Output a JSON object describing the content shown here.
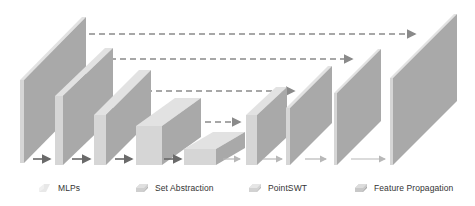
{
  "diagram": {
    "colors": {
      "front_light": "#d6d6d6",
      "side_dark": "#a9a9a9",
      "top_light": "#e2e2e2",
      "edge_thin": "#e8e8e8",
      "arrow_dark": "#6a6a6a",
      "arrow_light": "#b8b8b8",
      "dash": "#8a8a8a"
    },
    "blocks": [
      {
        "id": "enc1",
        "type": "MLPs",
        "x": 20,
        "y_top": 80,
        "bottom": 163,
        "depth_x": 62,
        "depth_y": 63,
        "thickness": 4
      },
      {
        "id": "enc2",
        "type": "Set Abstraction",
        "x": 55,
        "y_top": 96,
        "bottom": 165,
        "depth_x": 50,
        "depth_y": 48,
        "thickness": 8
      },
      {
        "id": "enc3",
        "type": "Set Abstraction",
        "x": 94,
        "y_top": 115,
        "bottom": 165,
        "depth_x": 45,
        "depth_y": 45,
        "thickness": 12
      },
      {
        "id": "enc4",
        "type": "Set Abstraction",
        "x": 136,
        "y_top": 126,
        "bottom": 165,
        "depth_x": 39,
        "depth_y": 28,
        "thickness": 26
      },
      {
        "id": "bottleneck",
        "type": "PointSWT",
        "x": 184,
        "y_top": 149,
        "bottom": 165,
        "depth_x": 29,
        "depth_y": 17,
        "thickness": 32
      },
      {
        "id": "dec1",
        "type": "Feature Propagation",
        "x": 246,
        "y_top": 115,
        "bottom": 165,
        "depth_x": 30,
        "depth_y": 28,
        "thickness": 11
      },
      {
        "id": "dec2",
        "type": "Feature Propagation",
        "x": 286,
        "y_top": 108,
        "bottom": 165,
        "depth_x": 42,
        "depth_y": 42,
        "thickness": 4
      },
      {
        "id": "dec3",
        "type": "Feature Propagation",
        "x": 334,
        "y_top": 93,
        "bottom": 165,
        "depth_x": 44,
        "depth_y": 44,
        "thickness": 3
      },
      {
        "id": "dec4",
        "type": "Feature Propagation",
        "x": 390,
        "y_top": 78,
        "bottom": 165,
        "depth_x": 64,
        "depth_y": 64,
        "thickness": 3
      }
    ],
    "skip_connections": [
      {
        "from": "enc1",
        "to": "dec4",
        "y": 34,
        "x1": 89,
        "x2": 415
      },
      {
        "from": "enc2",
        "to": "dec3",
        "y": 59,
        "x1": 110,
        "x2": 352
      },
      {
        "from": "enc3",
        "to": "dec2",
        "y": 91,
        "x1": 146,
        "x2": 294
      },
      {
        "from": "enc4",
        "to": "dec1",
        "y": 122,
        "x1": 185,
        "x2": 240
      }
    ],
    "flow_arrows": [
      {
        "x1": 33,
        "x2": 50,
        "y": 159,
        "style": "dark"
      },
      {
        "x1": 72,
        "x2": 90,
        "y": 159,
        "style": "dark"
      },
      {
        "x1": 115,
        "x2": 132,
        "y": 159,
        "style": "dark"
      },
      {
        "x1": 164,
        "x2": 181,
        "y": 159,
        "style": "dark"
      },
      {
        "x1": 223,
        "x2": 240,
        "y": 159,
        "style": "light"
      },
      {
        "x1": 263,
        "x2": 282,
        "y": 159,
        "style": "light"
      },
      {
        "x1": 305,
        "x2": 326,
        "y": 159,
        "style": "light"
      },
      {
        "x1": 351,
        "x2": 385,
        "y": 159,
        "style": "light"
      }
    ]
  },
  "legend": {
    "items": [
      {
        "label": "MLPs",
        "x": 38,
        "swatch": "mlps"
      },
      {
        "label": "Set Abstraction",
        "x": 135,
        "swatch": "set-abstraction"
      },
      {
        "label": "PointSWT",
        "x": 248,
        "swatch": "pointswt"
      },
      {
        "label": "Feature Propagation",
        "x": 354,
        "swatch": "feature-propagation"
      }
    ]
  }
}
